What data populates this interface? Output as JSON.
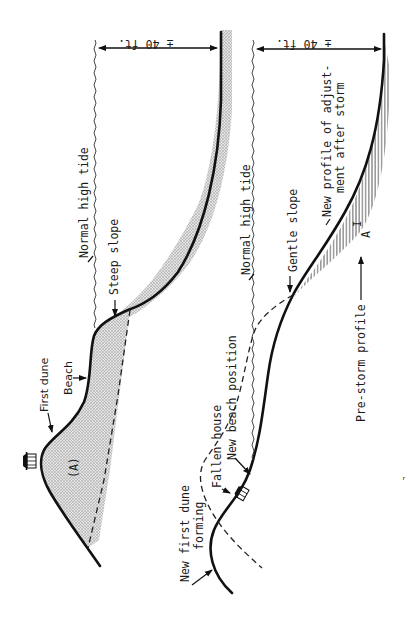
{
  "figure": {
    "orientation": "rotated 90deg counter-clockwise (text reads bottom-to-top)",
    "top_panel": {
      "title": "Pre-storm beach profile",
      "labels": {
        "dimension": "± 40 ft.",
        "tide": "Normal high tide",
        "steep_slope": "Steep slope",
        "beach": "Beach",
        "first_dune": "First dune",
        "area": "(A)"
      },
      "colors": {
        "sand_fill": "#c8c8c8",
        "profile_line": "#111111"
      }
    },
    "bottom_panel": {
      "title": "Post-storm beach profile",
      "labels": {
        "dimension": "± 40 ft.",
        "tide": "Normal high tide",
        "gentle_slope": "Gentle slope",
        "new_profile_line1": "New profile of adjust-",
        "new_profile_line2": "ment after storm",
        "area": "A",
        "area_prime": "I",
        "pre_storm": "Pre-storm profile",
        "new_beach": "New beach position",
        "fallen_house": "Fallen house",
        "new_dune_line1": "New first dune",
        "new_dune_line2": "forming"
      },
      "colors": {
        "hatch": "#222222",
        "profile_line": "#111111"
      }
    }
  }
}
